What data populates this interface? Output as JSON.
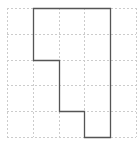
{
  "diagram": {
    "type": "grid-polyomino",
    "grid": {
      "columns": 5,
      "rows": 5,
      "origin_px": [
        7,
        8
      ],
      "cell_px": 25.8,
      "line_color": "#cccccc",
      "line_style": "dashed"
    },
    "shape": {
      "stroke_color": "#555555",
      "stroke_width": 1.3,
      "vertices_cells": [
        [
          1,
          0
        ],
        [
          4,
          0
        ],
        [
          4,
          5
        ],
        [
          3,
          5
        ],
        [
          3,
          4
        ],
        [
          2,
          4
        ],
        [
          2,
          2
        ],
        [
          1,
          2
        ]
      ]
    }
  }
}
